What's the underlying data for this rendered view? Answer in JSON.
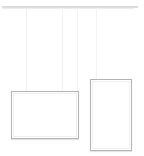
{
  "scene": {
    "title": "Two blank picture frames hanging from a rail",
    "background_color": "#ffffff",
    "width": 144,
    "height": 156
  },
  "rail": {
    "name": "hanging-rail",
    "color": "#c9c9c9",
    "x": 2,
    "y": 6,
    "width": 136,
    "thickness": 2
  },
  "wires": [
    {
      "name": "wire-1",
      "x": 26,
      "top": 8,
      "bottom": 91,
      "color": "#eeeeee"
    },
    {
      "name": "wire-2",
      "x": 62,
      "top": 8,
      "bottom": 91,
      "color": "#f1f1f1"
    },
    {
      "name": "wire-3",
      "x": 77,
      "top": 8,
      "bottom": 91,
      "color": "#f3f3f3"
    },
    {
      "name": "wire-4",
      "x": 96,
      "top": 8,
      "bottom": 79,
      "color": "#f1f1f1"
    }
  ],
  "frames": [
    {
      "name": "frame-landscape-left",
      "orientation": "landscape",
      "x": 11,
      "y": 91,
      "width": 68,
      "height": 48,
      "border_color": "#b4b4b4",
      "fill_color": "#ffffff",
      "label": ""
    },
    {
      "name": "frame-portrait-right",
      "orientation": "portrait",
      "x": 90,
      "y": 79,
      "width": 42,
      "height": 72,
      "border_color": "#aeaeae",
      "fill_color": "#ffffff",
      "label": ""
    }
  ]
}
